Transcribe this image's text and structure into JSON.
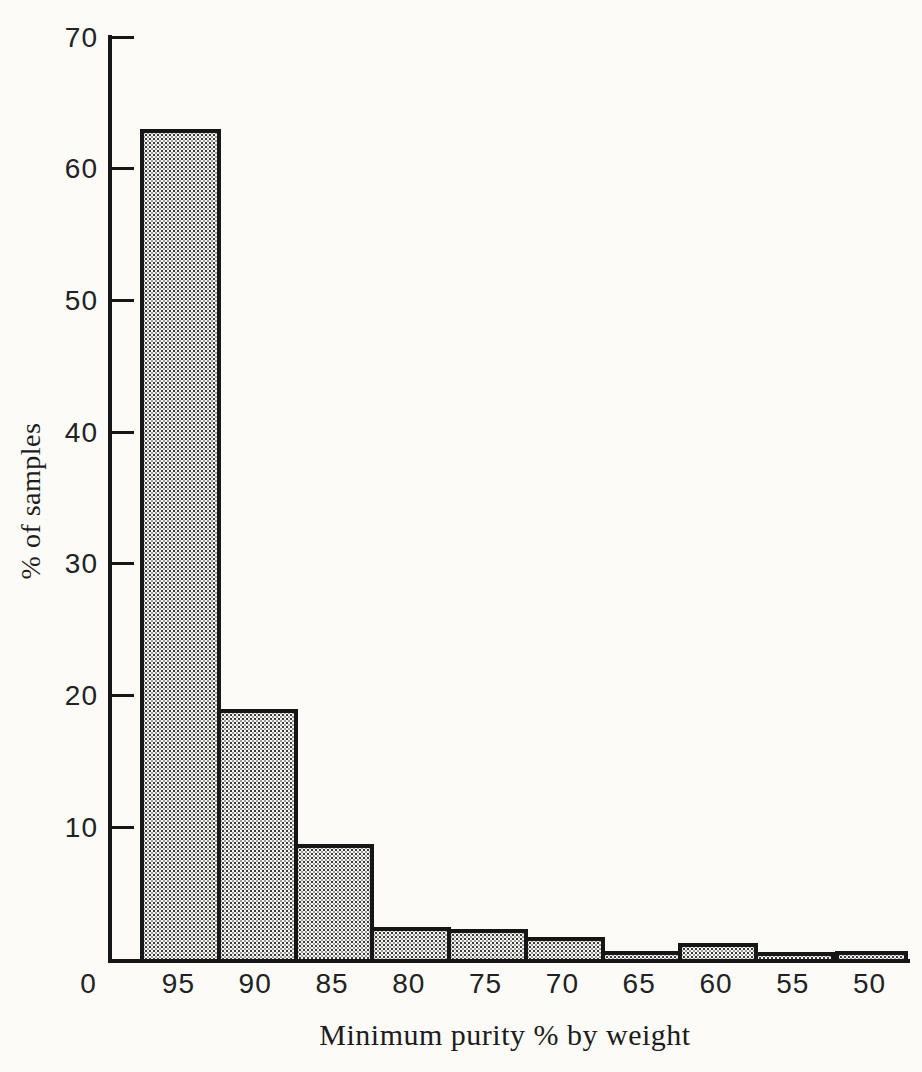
{
  "figure": {
    "background_color": "#fcfbf8",
    "ink_color": "#161616",
    "bar_fill_base": "#f5f4f0",
    "bar_dot_color": "#3c3c3c"
  },
  "chart_data": {
    "type": "bar",
    "title": "",
    "categories": [
      "95",
      "90",
      "85",
      "80",
      "75",
      "70",
      "65",
      "60",
      "55",
      "50"
    ],
    "values": [
      63,
      19,
      8.7,
      2.4,
      2.3,
      1.7,
      0.6,
      1.2,
      0.5,
      0.6
    ],
    "xlabel": "Minimum purity % by weight",
    "ylabel": "% of samples",
    "ylim": [
      0,
      70
    ],
    "yticks": [
      70,
      60,
      50,
      40,
      30,
      20,
      10
    ],
    "x_origin_label": "0",
    "grid": false,
    "legend": "none",
    "bar_fill": "halftone-dot-screen"
  }
}
